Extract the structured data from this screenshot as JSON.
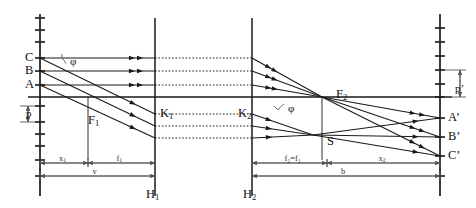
{
  "figure": {
    "type": "optical-ray-diagram",
    "background": "#ffffff",
    "line_color": "#1a1a1a",
    "dim_color": "#555555"
  },
  "object_points": [
    {
      "name": "C",
      "label": "C",
      "x": 40,
      "y": 58
    },
    {
      "name": "B",
      "label": "B",
      "x": 40,
      "y": 71
    },
    {
      "name": "A",
      "label": "A",
      "x": 40,
      "y": 85
    }
  ],
  "image_points": [
    {
      "name": "A-prime",
      "label": "A’",
      "x": 440,
      "y": 118
    },
    {
      "name": "B-prime",
      "label": "B’",
      "x": 440,
      "y": 137
    },
    {
      "name": "C-prime",
      "label": "C’",
      "x": 440,
      "y": 156
    }
  ],
  "cardinal_points": [
    {
      "name": "focal-point-1",
      "label": "F",
      "sub": "1",
      "x": 88,
      "y": 114
    },
    {
      "name": "focal-point-2",
      "label": "F",
      "sub": "2",
      "x": 336,
      "y": 88
    },
    {
      "name": "node-k1",
      "label": "K",
      "sub": "1",
      "x": 160,
      "y": 107
    },
    {
      "name": "node-k2",
      "label": "K",
      "sub": "2",
      "x": 238,
      "y": 107
    },
    {
      "name": "point-s",
      "label": "S",
      "x": 327,
      "y": 135
    }
  ],
  "planes": [
    {
      "name": "principal-plane-h1",
      "label": "H",
      "sub": "1",
      "x": 155,
      "label_x": 146,
      "label_y": 188
    },
    {
      "name": "principal-plane-h2",
      "label": "H",
      "sub": "2",
      "x": 252,
      "label_x": 243,
      "label_y": 188
    }
  ],
  "axes": [
    {
      "name": "object-scale-axis",
      "x": 40,
      "y_top": 14,
      "y_bottom": 196
    },
    {
      "name": "image-scale-axis",
      "x": 440,
      "y_top": 14,
      "y_bottom": 196
    }
  ],
  "optical_axis": {
    "name": "optical-axis",
    "y": 97,
    "x_start": 28,
    "x_end": 452
  },
  "angle_labels": [
    {
      "name": "angle-phi-object",
      "label": "φ",
      "x": 70,
      "y": 56
    },
    {
      "name": "angle-phi-image",
      "label": "φ",
      "x": 288,
      "y": 103
    }
  ],
  "height_labels": [
    {
      "name": "object-height-p",
      "label": "p",
      "x": 26,
      "y": 108
    },
    {
      "name": "image-height-p-prime",
      "label": "p’",
      "x": 455,
      "y": 83
    }
  ],
  "dimensions": [
    {
      "name": "dim-x1",
      "label": "x",
      "sub": "1",
      "x_start": 40,
      "x_end": 88,
      "y": 163
    },
    {
      "name": "dim-f1",
      "label": "f",
      "sub": "1",
      "x_start": 88,
      "x_end": 155,
      "y": 163
    },
    {
      "name": "dim-v",
      "label": "v",
      "x_start": 40,
      "x_end": 155,
      "y": 176
    },
    {
      "name": "dim-f2-f1",
      "label": "f₂=f₁",
      "x_start": 252,
      "x_end": 327,
      "y": 163
    },
    {
      "name": "dim-x2",
      "label": "x",
      "sub": "2",
      "x_start": 327,
      "x_end": 440,
      "y": 163
    },
    {
      "name": "dim-b",
      "label": "b",
      "x_start": 252,
      "x_end": 440,
      "y": 176
    }
  ],
  "scale_ticks": {
    "left_axis_y": [
      18,
      30,
      42,
      58,
      71,
      85,
      106,
      122,
      134,
      146,
      160,
      176
    ],
    "right_axis_y": [
      28,
      42,
      56,
      70,
      84,
      97,
      118,
      137,
      156,
      176
    ]
  },
  "chart_data": {
    "type": "line",
    "object_rays": [
      {
        "from": "C",
        "y_in": 58
      },
      {
        "from": "B",
        "y_in": 71
      },
      {
        "from": "A",
        "y_in": 85
      }
    ],
    "image_rays": [
      {
        "to": "A'",
        "y_out": 118
      },
      {
        "to": "B'",
        "y_out": 137
      },
      {
        "to": "C'",
        "y_out": 156
      }
    ]
  }
}
